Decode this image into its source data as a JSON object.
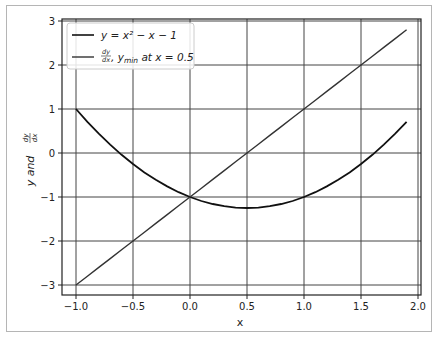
{
  "chart_data": {
    "type": "line",
    "title": "",
    "xlabel": "x",
    "ylabel": "y and dy/dx",
    "xlim": [
      -1.1,
      2.05
    ],
    "ylim": [
      -3.3,
      3.05
    ],
    "grid": true,
    "legend_position": "upper left",
    "x_ticks": [
      "-1.0",
      "-0.5",
      "0.0",
      "0.5",
      "1.0",
      "1.5",
      "2.0"
    ],
    "y_ticks": [
      "-3",
      "-2",
      "-1",
      "0",
      "1",
      "2",
      "3"
    ],
    "x": [
      -1.0,
      -0.9,
      -0.8,
      -0.7,
      -0.6,
      -0.5,
      -0.4,
      -0.3,
      -0.2,
      -0.1,
      0.0,
      0.1,
      0.2,
      0.3,
      0.4,
      0.5,
      0.6,
      0.7,
      0.8,
      0.9,
      1.0,
      1.1,
      1.2,
      1.3,
      1.4,
      1.5,
      1.6,
      1.7,
      1.8,
      1.9
    ],
    "series": [
      {
        "name": "y = x^2 - x - 1",
        "color": "#111111",
        "values": [
          1.0,
          0.71,
          0.44,
          0.19,
          -0.04,
          -0.25,
          -0.44,
          -0.61,
          -0.76,
          -0.89,
          -1.0,
          -1.09,
          -1.16,
          -1.21,
          -1.24,
          -1.25,
          -1.24,
          -1.21,
          -1.16,
          -1.09,
          -1.0,
          -0.89,
          -0.76,
          -0.61,
          -0.44,
          -0.25,
          -0.04,
          0.19,
          0.44,
          0.71
        ]
      },
      {
        "name": "dy/dx, y_min at x = 0.5",
        "color": "#333333",
        "values": [
          -3.0,
          -2.8,
          -2.6,
          -2.4,
          -2.2,
          -2.0,
          -1.8,
          -1.6,
          -1.4,
          -1.2,
          -1.0,
          -0.8,
          -0.6,
          -0.4,
          -0.2,
          0.0,
          0.2,
          0.4,
          0.6,
          0.8,
          1.0,
          1.2,
          1.4,
          1.6,
          1.8,
          2.0,
          2.2,
          2.4,
          2.6,
          2.8
        ]
      }
    ]
  },
  "legend": {
    "entry1": "y = x² − x − 1",
    "entry2_frac_num": "dy",
    "entry2_frac_den": "dx",
    "entry2_rest": ",  y",
    "entry2_sub": "min",
    "entry2_tail": " at x = 0.5"
  },
  "axis": {
    "xlabel": "x",
    "ylabel_main": "y and ",
    "ylabel_frac_num": "dy",
    "ylabel_frac_den": "dx"
  }
}
